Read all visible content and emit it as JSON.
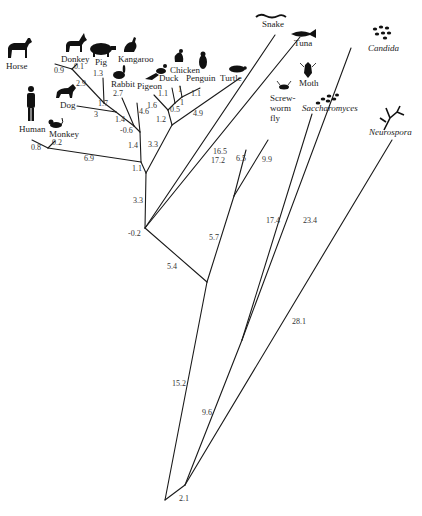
{
  "diagram": {
    "type": "phylogenetic-tree",
    "line_color": "#1a1a1a",
    "text_color": "#222222"
  },
  "taxa": {
    "horse": "Horse",
    "donkey": "Donkey",
    "pig": "Pig",
    "kangaroo": "Kangaroo",
    "rabbit": "Rabbit",
    "dog": "Dog",
    "human": "Human",
    "monkey": "Monkey",
    "pigeon": "Pigeon",
    "duck": "Duck",
    "chicken": "Chicken",
    "penguin": "Penguin",
    "turtle": "Turtle",
    "snake": "Snake",
    "tuna": "Tuna",
    "moth": "Moth",
    "screwworm_1": "Screw-",
    "screwworm_2": "worm",
    "screwworm_3": "fly",
    "saccharomyces": "Saccharomyces",
    "candida": "Candida",
    "neurospora": "Neurospora"
  },
  "branch_lengths": {
    "horse": "0.9",
    "donkey": "0.1",
    "horse_donkey": "2.9",
    "pig": "1.3",
    "dog": "3",
    "ungulate_pig": "1.7",
    "rabbit": "2.7",
    "mammal_inner": "1.4",
    "placental": "-0.6",
    "kangaroo": "4.6",
    "mammals_to_node": "1.4",
    "human": "0.8",
    "monkey": "0.2",
    "primates": "6.9",
    "mammals_root": "1.1",
    "pigeon": "1.6",
    "duck": "1.1",
    "chicken": "1",
    "penguin": "1.1",
    "chicken_penguin": "1",
    "duck_group": "0.5",
    "birds": "1.2",
    "turtle": "4.9",
    "reptiles": "3.3",
    "amniotes": "3.3",
    "snake": "16.5",
    "tuna": "17.2",
    "vertebrates": "-0.2",
    "screwworm": "6.5",
    "moth": "9.9",
    "insects": "5.7",
    "animals": "5.4",
    "metazoa": "15.2",
    "saccharomyces": "17.4",
    "candida": "23.4",
    "yeasts": "9.6",
    "neurospora": "28.1",
    "fungi_root": "2.1"
  }
}
